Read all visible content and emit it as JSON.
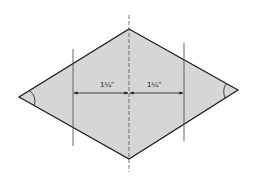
{
  "diagram": {
    "type": "diamond-measurement",
    "shape_fill": "#d6d6d6",
    "outline_color": "#1a1a1a",
    "guide_color": "#444444",
    "vertices": {
      "top": [
        129,
        29
      ],
      "right": [
        238,
        90
      ],
      "bottom": [
        129,
        159
      ],
      "left": [
        19,
        97
      ]
    },
    "centerline": {
      "x": 129,
      "y1": 15,
      "y2": 172,
      "style": "dashed"
    },
    "guide_lines": [
      {
        "x": 73,
        "y1": 49,
        "y2": 146
      },
      {
        "x": 184,
        "y1": 43,
        "y2": 141
      }
    ],
    "dimensions": [
      {
        "label": "1¼\"",
        "x1": 73,
        "x2": 129,
        "y": 93,
        "label_x": 107,
        "label_y": 86
      },
      {
        "label": "1¼\"",
        "x1": 129,
        "x2": 184,
        "y": 93,
        "label_x": 154,
        "label_y": 86
      }
    ],
    "angle_marks": [
      {
        "vertex": "left"
      },
      {
        "vertex": "right"
      }
    ]
  }
}
